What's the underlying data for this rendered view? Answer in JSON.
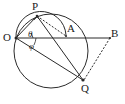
{
  "figure": {
    "kind": "geometry-diagram",
    "stroke_color": "#2b2b2b",
    "background_color": "#ffffff",
    "label_color": "#1a1a1a"
  },
  "points": {
    "O": {
      "label": "O",
      "x": 16,
      "y": 38
    },
    "P": {
      "label": "P",
      "x": 37,
      "y": 16
    },
    "A": {
      "label": "A",
      "x": 66,
      "y": 35
    },
    "B": {
      "label": "B",
      "x": 110,
      "y": 38
    },
    "Q": {
      "label": "Q",
      "x": 83,
      "y": 80
    }
  },
  "angles": {
    "theta": {
      "label": "θ",
      "at": "O",
      "between": "OP and OA"
    },
    "phi": {
      "label": "φ",
      "at": "O",
      "between": "OA and OQ"
    }
  },
  "shapes": {
    "main_circle": {
      "cx": 51,
      "cy": 51,
      "r": 37
    },
    "small_semicircle": {
      "from": "O",
      "to": "A",
      "through": "P"
    },
    "solid_segments": [
      "OP",
      "OA",
      "OB",
      "OQ",
      "PQ",
      "PA"
    ],
    "dashed_segments": [
      "PA-chord",
      "BQ"
    ]
  }
}
